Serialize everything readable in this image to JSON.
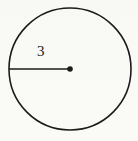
{
  "figure": {
    "type": "geometry-diagram",
    "background_color": "#fbfbf8",
    "stroke_color": "#1b1b1b",
    "circle": {
      "center_x": 70,
      "center_y": 69,
      "radius_px": 61,
      "stroke_width": 1.6
    },
    "radius_segment": {
      "label": "3",
      "from_x": 9,
      "from_y": 69,
      "to_x": 70,
      "to_y": 69,
      "stroke_width": 1.6
    },
    "center_point": {
      "marker": "filled-dot",
      "x": 70,
      "y": 69,
      "radius_px": 2.8
    },
    "label": {
      "text": "3",
      "x": 37,
      "y": 44,
      "font_size_px": 15
    }
  },
  "chart_data": {
    "type": "scatter",
    "title": "",
    "xlabel": "",
    "ylabel": "",
    "annotations": [
      "3"
    ]
  }
}
